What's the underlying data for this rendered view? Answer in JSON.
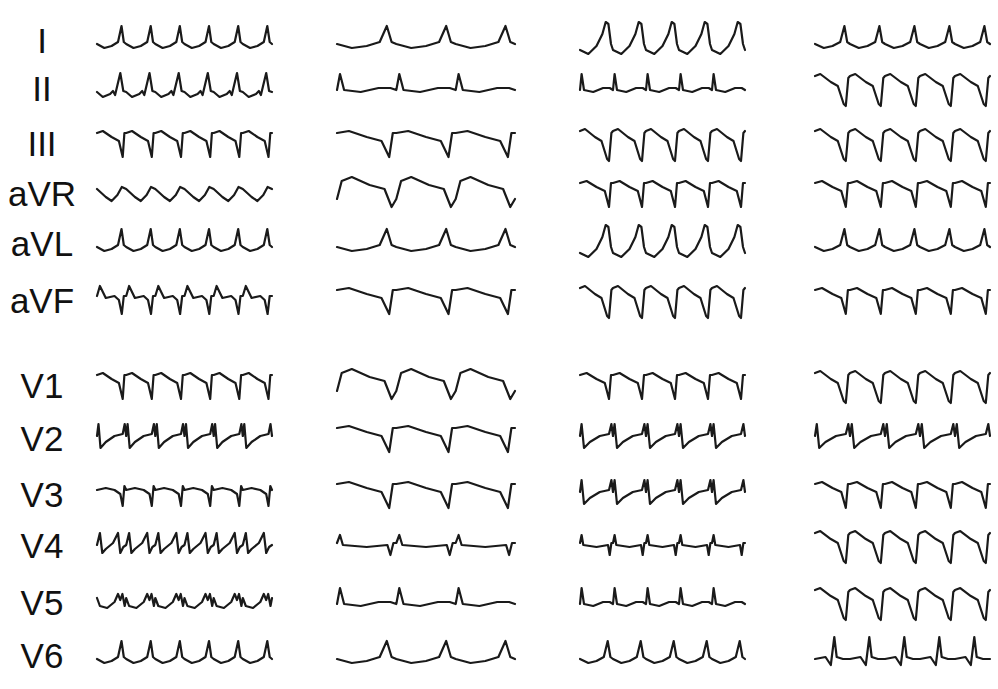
{
  "figure": {
    "background": "#ffffff",
    "trace_color": "#1a1a1a",
    "panel_count": 4,
    "leads": [
      {
        "label": "I",
        "y": 40
      },
      {
        "label": "II",
        "y": 88
      },
      {
        "label": "III",
        "y": 143
      },
      {
        "label": "aVR",
        "y": 193
      },
      {
        "label": "aVL",
        "y": 243
      },
      {
        "label": "aVF",
        "y": 300
      },
      {
        "label": "V1",
        "y": 385
      },
      {
        "label": "V2",
        "y": 438
      },
      {
        "label": "V3",
        "y": 494
      },
      {
        "label": "V4",
        "y": 545
      },
      {
        "label": "V5",
        "y": 602
      },
      {
        "label": "V6",
        "y": 655
      }
    ],
    "panels": [
      {
        "name": "panel-1",
        "x0": 97,
        "x1": 272,
        "beats": 6,
        "shapes": [
          "pk",
          "pkn",
          "qsd",
          "wave",
          "pk",
          "rsq",
          "qsd",
          "rs",
          "qsn",
          "mix",
          "mpk",
          "pk"
        ]
      },
      {
        "name": "panel-2",
        "x0": 337,
        "x1": 515,
        "beats": 3,
        "shapes": [
          "pk",
          "spk",
          "qsd",
          "dome",
          "pk",
          "qsd",
          "dome",
          "qsd",
          "qsd",
          "flatq",
          "spk",
          "pk"
        ]
      },
      {
        "name": "panel-3",
        "x0": 580,
        "x1": 745,
        "beats": 5,
        "shapes": [
          "tall",
          "spk",
          "qsdeep",
          "qsd",
          "tall",
          "qsdeep",
          "qsd",
          "rs",
          "rs",
          "flatq",
          "spk",
          "pk"
        ]
      },
      {
        "name": "panel-4",
        "x0": 815,
        "x1": 990,
        "beats": 5,
        "shapes": [
          "pk",
          "qsdeep",
          "qsdeep",
          "qsd",
          "pk",
          "qsd",
          "qsdeep",
          "rs",
          "qsd",
          "qsdeep",
          "qsdeep",
          "rpk"
        ]
      }
    ]
  }
}
